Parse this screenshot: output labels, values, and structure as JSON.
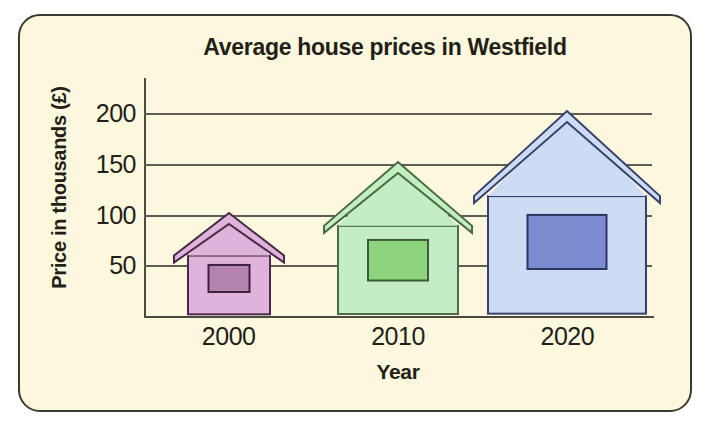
{
  "chart_data": {
    "type": "bar",
    "title": "Average house prices in Westfield",
    "xlabel": "Year",
    "ylabel": "Price in thousands (£)",
    "categories": [
      "2000",
      "2010",
      "2020"
    ],
    "values": [
      100,
      150,
      200
    ],
    "ylim": [
      0,
      225
    ],
    "yticks": [
      50,
      100,
      150,
      200
    ],
    "ytick_labels": [
      "50",
      "100",
      "150",
      "200"
    ],
    "grid": true,
    "legend": false,
    "marker_style": "house-pictogram",
    "series": [
      {
        "name": "Average house price",
        "values": [
          100,
          150,
          200
        ]
      }
    ],
    "points": [
      {
        "category": "2000",
        "value": 100,
        "body_color": "#e0b3dd",
        "roof_color": "#e0b3dd",
        "outline_color": "#4a2a4a",
        "window_color": "#b483b0",
        "window_outline": "#3d2240"
      },
      {
        "category": "2010",
        "value": 150,
        "body_color": "#c3edc3",
        "roof_color": "#c3edc3",
        "outline_color": "#4a6b43",
        "window_color": "#8ed47f",
        "window_outline": "#3d5c36"
      },
      {
        "category": "2020",
        "value": 200,
        "body_color": "#ccdcf5",
        "roof_color": "#ccdcf5",
        "outline_color": "#3a3f6b",
        "window_color": "#7a8bd0",
        "window_outline": "#2f3560"
      }
    ]
  },
  "frame": {
    "background_color": "#fbf8dd",
    "border_color": "#3a3a33",
    "text_color": "#231f18",
    "gridline_color": "#5d5d55",
    "axis_color": "#4a4a42"
  }
}
